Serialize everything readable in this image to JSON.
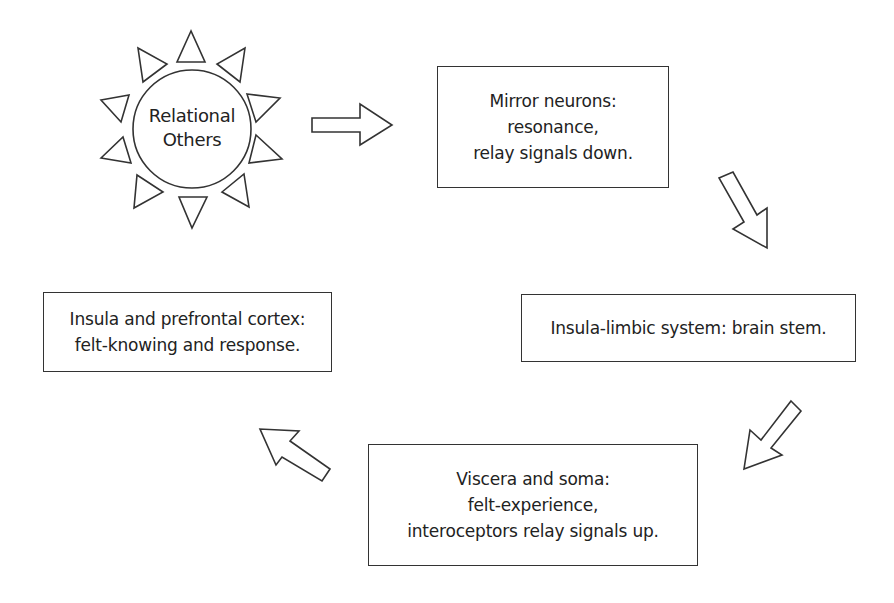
{
  "diagram": {
    "type": "cycle-flow",
    "colors": {
      "stroke": "#333333",
      "fill": "#ffffff",
      "text": "#222222"
    },
    "source": {
      "shape": "sun",
      "icon": "sun-icon",
      "lines": [
        "Relational",
        "Others"
      ]
    },
    "nodes": [
      {
        "id": "mirror-neurons",
        "lines": [
          "Mirror neurons:",
          "resonance,",
          "relay signals down."
        ]
      },
      {
        "id": "insula-limbic",
        "lines": [
          "Insula-limbic system: brain stem."
        ]
      },
      {
        "id": "viscera-soma",
        "lines": [
          "Viscera and soma:",
          "felt-experience,",
          "interoceptors relay signals up."
        ]
      },
      {
        "id": "insula-prefrontal",
        "lines": [
          "Insula and prefrontal cortex:",
          "felt-knowing and response."
        ]
      }
    ],
    "arrows": [
      {
        "from": "relational-others",
        "to": "mirror-neurons",
        "direction": "right",
        "icon": "arrow-right-icon"
      },
      {
        "from": "mirror-neurons",
        "to": "insula-limbic",
        "direction": "down-right",
        "icon": "arrow-down-right-icon"
      },
      {
        "from": "insula-limbic",
        "to": "viscera-soma",
        "direction": "down-left",
        "icon": "arrow-down-left-icon"
      },
      {
        "from": "viscera-soma",
        "to": "insula-prefrontal",
        "direction": "up-left",
        "icon": "arrow-up-left-icon"
      }
    ]
  }
}
